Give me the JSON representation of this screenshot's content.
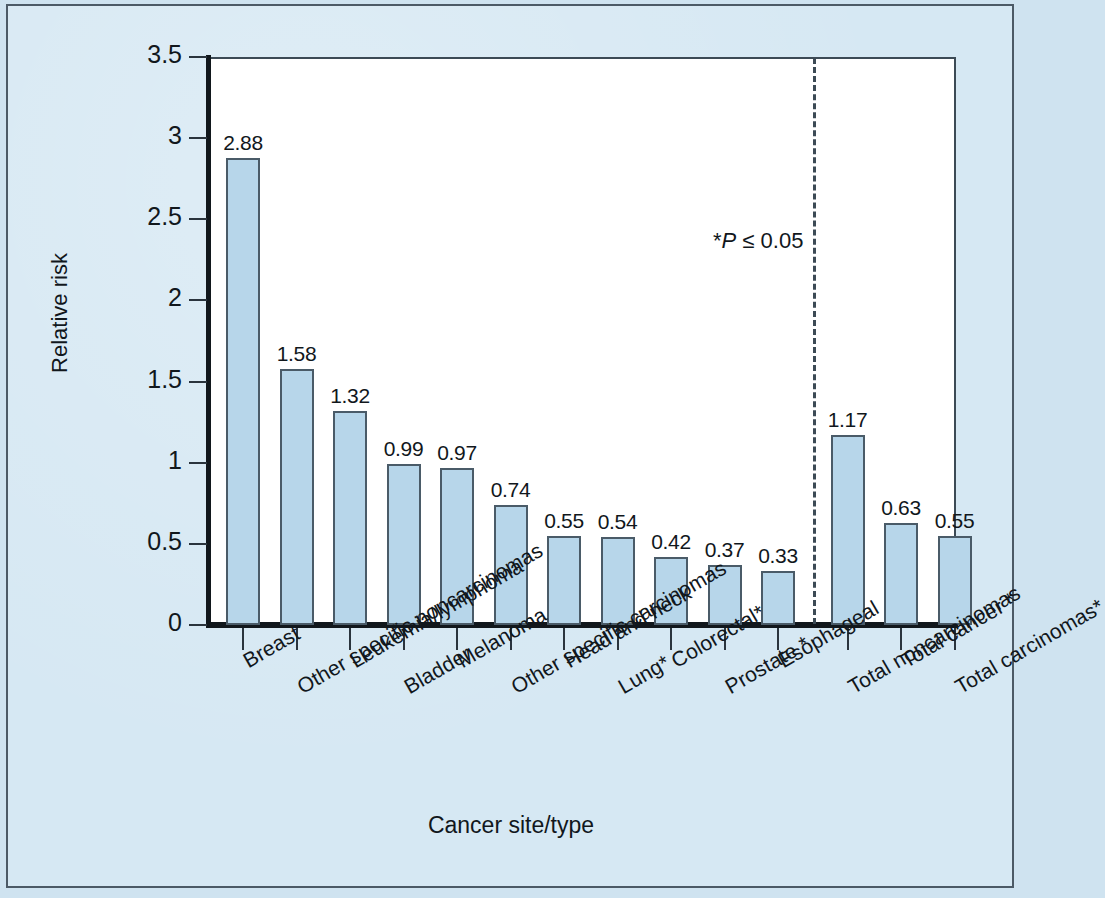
{
  "figure": {
    "background_color": "#d6e8f3",
    "plot_background_color": "#ffffff",
    "frame_border_color": "#4c5a66",
    "bar_fill_color": "#b7d6ea",
    "bar_stroke_color": "#4a5b68",
    "axis_color": "#11171c",
    "divider_style": "dashed"
  },
  "annotations": {
    "significance_prefix": "*",
    "significance_symbol": "P",
    "significance_rest": " ≤ 0.05",
    "significance_full": "*P ≤ 0.05"
  },
  "chart_data": {
    "type": "bar",
    "title": "",
    "xlabel": "Cancer site/type",
    "ylabel": "Relative risk",
    "ylim": [
      0,
      3.5
    ],
    "ytick_labels": [
      "3.5",
      "3",
      "2.5",
      "2",
      "1.5",
      "1",
      "0.5",
      "0"
    ],
    "ytick_values": [
      3.5,
      3,
      2.5,
      2,
      1.5,
      1,
      0.5,
      0
    ],
    "grid": false,
    "legend": null,
    "categories": [
      "Breast",
      "Other specific noncarcinomas",
      "Leukemia/lymphoma",
      "Bladder",
      "Melanoma",
      "Other specific carcinomas",
      "Head and neck",
      "Lung*",
      "Colorectal*",
      "Prostate *",
      "Esophageal",
      "Total noncarcinomas",
      "Total cancer *",
      "Total carcinomas*"
    ],
    "values": [
      2.88,
      1.58,
      1.32,
      0.99,
      0.97,
      0.74,
      0.55,
      0.54,
      0.42,
      0.37,
      0.33,
      1.17,
      0.63,
      0.55
    ],
    "value_labels": [
      "2.88",
      "1.58",
      "1.32",
      "0.99",
      "0.97",
      "0.74",
      "0.55",
      "0.54",
      "0.42",
      "0.37",
      "0.33",
      "1.17",
      "0.63",
      "0.55"
    ],
    "divider_after_category_index": 10,
    "divider_note": "*P ≤ 0.05"
  }
}
